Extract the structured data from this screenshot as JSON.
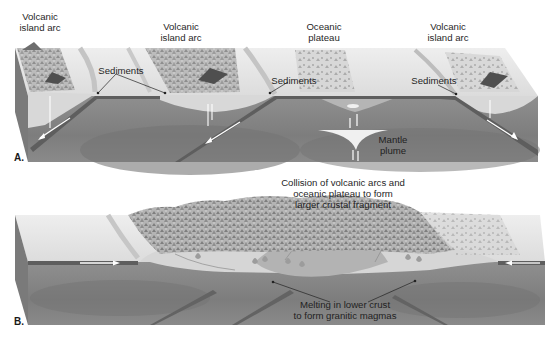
{
  "figure": {
    "type": "geologic block diagram",
    "colors": {
      "mantle": "#8e8e8e",
      "mantle_dark": "#6f6f6f",
      "crust_light": "#d9d9d9",
      "sea_surface": "#e6e6e6",
      "oceanic_plate": "#5e5e5e",
      "front_face": "#9a9a9a",
      "side_face": "#7a7a7a",
      "terrain": "#a8a8a8",
      "text": "#1f1f1f"
    }
  },
  "panel_a": {
    "letter": "A.",
    "labels": {
      "arc_left_l1": "Volcanic",
      "arc_left_l2": "island arc",
      "arc_mid_l1": "Volcanic",
      "arc_mid_l2": "island arc",
      "plateau_l1": "Oceanic",
      "plateau_l2": "plateau",
      "arc_right_l1": "Volcanic",
      "arc_right_l2": "island arc",
      "sediments_left": "Sediments",
      "sediments_mid": "Sediments",
      "sediments_right": "Sediments",
      "plume_l1": "Mantle",
      "plume_l2": "plume"
    }
  },
  "panel_b": {
    "letter": "B.",
    "labels": {
      "collision_l1": "Collision of volcanic arcs and",
      "collision_l2": "oceanic plateau to form",
      "collision_l3": "larger crustal fragment",
      "melting_l1": "Melting in lower crust",
      "melting_l2": "to form granitic magmas"
    }
  }
}
